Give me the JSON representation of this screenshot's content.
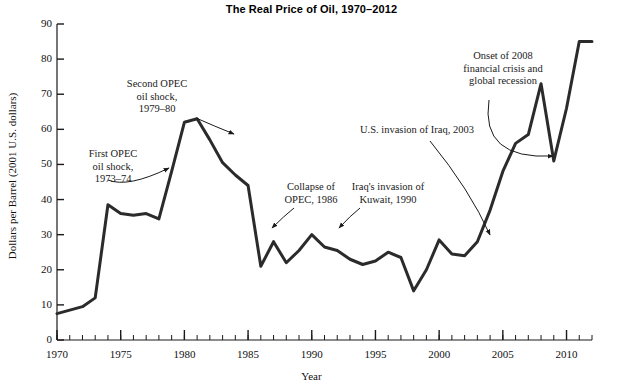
{
  "chart_data": {
    "type": "line",
    "title": "The Real Price of Oil, 1970–2012",
    "xlabel": "Year",
    "ylabel": "Dollars per Barrel (2001 U.S. dollars)",
    "xlim": [
      1970,
      2012
    ],
    "ylim": [
      0,
      90
    ],
    "ytick_step": 10,
    "xtick_step": 5,
    "xminor_tick_step": 1,
    "grid": false,
    "legend": "none",
    "line_color": "#2b2b2b",
    "line_width_px": 3,
    "yticks": [
      0,
      10,
      20,
      30,
      40,
      50,
      60,
      70,
      80,
      90
    ],
    "xticks": [
      1970,
      1975,
      1980,
      1985,
      1990,
      1995,
      2000,
      2005,
      2010
    ],
    "x": [
      1970,
      1971,
      1972,
      1973,
      1974,
      1975,
      1976,
      1977,
      1978,
      1979,
      1980,
      1981,
      1982,
      1983,
      1984,
      1985,
      1986,
      1987,
      1988,
      1989,
      1990,
      1991,
      1992,
      1993,
      1994,
      1995,
      1996,
      1997,
      1998,
      1999,
      2000,
      2001,
      2002,
      2003,
      2004,
      2005,
      2006,
      2007,
      2008,
      2009,
      2010,
      2011,
      2012
    ],
    "values": [
      7.5,
      8.5,
      9.5,
      12.0,
      38.5,
      36.0,
      35.5,
      36.0,
      34.5,
      48.0,
      62.0,
      63.0,
      57.0,
      50.5,
      47.0,
      44.0,
      21.0,
      28.0,
      22.0,
      25.5,
      30.0,
      26.5,
      25.5,
      23.0,
      21.5,
      22.5,
      25.0,
      23.5,
      14.0,
      20.0,
      28.5,
      24.5,
      24.0,
      28.0,
      37.0,
      48.0,
      56.0,
      58.5,
      73.0,
      51.0,
      66.0,
      85.0,
      85.0
    ],
    "annotations": [
      {
        "id": "first-opec-oil-shock",
        "text": "First OPEC\noil shock,\n1973–74",
        "point_year": 1974,
        "point_value": 38.5
      },
      {
        "id": "second-opec-oil-shock",
        "text": "Second OPEC\noil shock,\n1979–80",
        "point_year": 1979,
        "point_value": 48.0
      },
      {
        "id": "collapse-of-opec",
        "text": "Collapse of\nOPEC, 1986",
        "point_year": 1986,
        "point_value": 21.0
      },
      {
        "id": "iraq-invasion-of-kuwait",
        "text": "Iraq's invasion of\nKuwait, 1990",
        "point_year": 1990,
        "point_value": 30.0
      },
      {
        "id": "us-invasion-of-iraq",
        "text": "U.S. invasion of Iraq, 2003",
        "point_year": 2003,
        "point_value": 28.0
      },
      {
        "id": "onset-of-2008-financial-crisis",
        "text": "Onset of 2008\nfinancial crisis and\nglobal recession",
        "point_year": 2009,
        "point_value": 51.0
      }
    ]
  },
  "labels": {
    "y": [
      "90",
      "80",
      "70",
      "60",
      "50",
      "40",
      "30",
      "20",
      "10",
      "0"
    ],
    "x": [
      "1970",
      "1975",
      "1980",
      "1985",
      "1990",
      "1995",
      "2000",
      "2005",
      "2010"
    ]
  },
  "annotation_text": {
    "first_opec": "First OPEC\noil shock,\n1973–74",
    "second_opec": "Second OPEC\noil shock,\n1979–80",
    "collapse_opec": "Collapse of\nOPEC, 1986",
    "kuwait": "Iraq's invasion of\nKuwait, 1990",
    "iraq_2003": "U.S. invasion of Iraq, 2003",
    "crisis_2008": "Onset of 2008\nfinancial crisis and\nglobal recession"
  }
}
